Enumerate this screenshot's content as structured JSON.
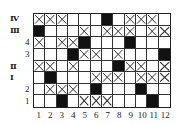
{
  "grid": {
    "columns": 12,
    "rows": 8,
    "row_labels": [
      "Ⅳ",
      "Ⅲ",
      "4",
      "3",
      "Ⅱ",
      "Ⅰ",
      "2",
      "1"
    ],
    "col_labels": [
      "1",
      "2",
      "3",
      "4",
      "5",
      "6",
      "7",
      "8",
      "9",
      "10",
      "11",
      "12"
    ],
    "legend": {
      "X": "crossed cell",
      "B": "filled black cell",
      "_": "empty cell"
    },
    "cells": [
      [
        "X",
        "X",
        "X",
        "_",
        "_",
        "_",
        "B",
        "_",
        "X",
        "X",
        "X",
        "_"
      ],
      [
        "B",
        "_",
        "_",
        "_",
        "X",
        "_",
        "X",
        "X",
        "X",
        "_",
        "X",
        "X"
      ],
      [
        "X",
        "_",
        "X",
        "X",
        "B",
        "_",
        "_",
        "_",
        "B",
        "_",
        "_",
        "_"
      ],
      [
        "_",
        "_",
        "_",
        "B",
        "X",
        "X",
        "_",
        "X",
        "_",
        "_",
        "_",
        "B"
      ],
      [
        "X",
        "X",
        "_",
        "X",
        "_",
        "_",
        "_",
        "B",
        "X",
        "X",
        "_",
        "X"
      ],
      [
        "_",
        "B",
        "_",
        "_",
        "_",
        "X",
        "X",
        "X",
        "_",
        "X",
        "X",
        "X"
      ],
      [
        "_",
        "X",
        "X",
        "X",
        "_",
        "B",
        "_",
        "_",
        "_",
        "B",
        "_",
        "_"
      ],
      [
        "_",
        "_",
        "B",
        "_",
        "X",
        "X",
        "X",
        "_",
        "_",
        "_",
        "B",
        "_"
      ]
    ]
  }
}
